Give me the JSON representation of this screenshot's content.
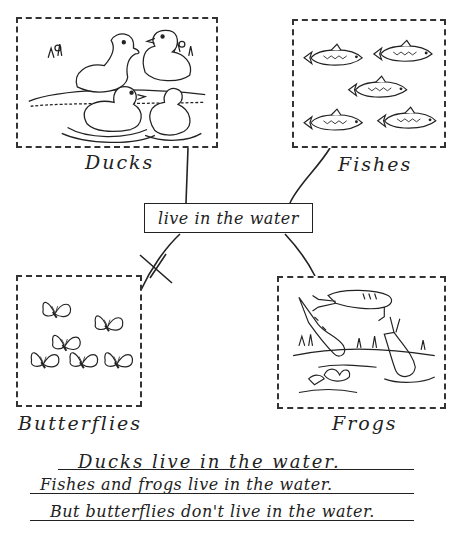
{
  "diagram": {
    "type": "concept-map",
    "center_node": {
      "label": "live in the water"
    },
    "nodes": [
      {
        "id": "ducks",
        "label": "Ducks",
        "illustration": "ducks-swimming-illustration",
        "connected": true
      },
      {
        "id": "fishes",
        "label": "Fishes",
        "illustration": "fish-school-illustration",
        "connected": true
      },
      {
        "id": "butterflies",
        "label": "Butterflies",
        "illustration": "butterflies-illustration",
        "connected": false,
        "link_marker": "crossed-out"
      },
      {
        "id": "frogs",
        "label": "Frogs",
        "illustration": "frogs-jumping-illustration",
        "connected": true
      }
    ]
  },
  "sentences": [
    "Ducks live in the water.",
    "Fishes and frogs live in the water.",
    "But butterflies don't live in the water."
  ]
}
